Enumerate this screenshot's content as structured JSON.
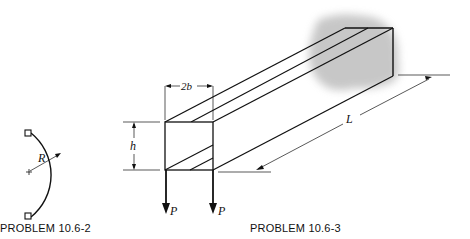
{
  "figures": [
    {
      "id": "left",
      "caption": "PROBLEM 10.6-2",
      "labels": {
        "radius": "R"
      },
      "shape": "semicircular arc with two end pin supports"
    },
    {
      "id": "right",
      "caption": "PROBLEM 10.6-3",
      "labels": {
        "width": "2b",
        "height": "h",
        "length": "L",
        "load_left": "P",
        "load_right": "P"
      },
      "shape": "cantilever box beam fixed to wall, two downward loads at free end"
    }
  ],
  "colors": {
    "line": "#111111",
    "wall_shade": "#9a9a9a"
  }
}
